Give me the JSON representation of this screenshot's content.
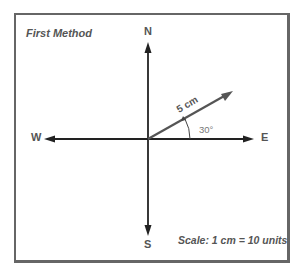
{
  "diagram": {
    "title": "First Method",
    "scale_note": "Scale: 1 cm = 10 units",
    "directions": {
      "north": "N",
      "south": "S",
      "east": "E",
      "west": "W"
    },
    "vector": {
      "magnitude_label": "5 cm",
      "angle_label": "30°",
      "angle_deg": 30
    },
    "colors": {
      "frame": "#666666",
      "arrows": "#222222",
      "vector": "#555555",
      "text": "#555555"
    }
  }
}
